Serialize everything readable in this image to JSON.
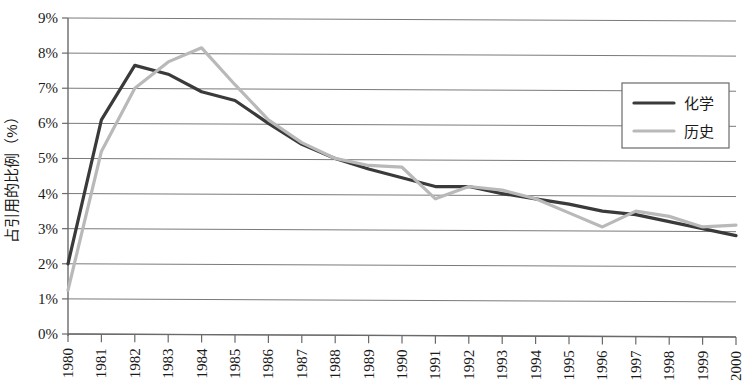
{
  "chart_data": {
    "type": "line",
    "title": "",
    "xlabel": "",
    "ylabel": "占引用的比例（%）",
    "x": [
      1980,
      1981,
      1982,
      1983,
      1984,
      1985,
      1986,
      1987,
      1988,
      1989,
      1990,
      1991,
      1992,
      1993,
      1994,
      1995,
      1996,
      1997,
      1998,
      1999,
      2000
    ],
    "categories": [
      "1980",
      "1981",
      "1982",
      "1983",
      "1984",
      "1985",
      "1986",
      "1987",
      "1988",
      "1989",
      "1990",
      "1991",
      "1992",
      "1993",
      "1994",
      "1995",
      "1996",
      "1997",
      "1998",
      "1999",
      "2000"
    ],
    "series": [
      {
        "name": "化学",
        "color": "#3a3a3a",
        "width": 3.2,
        "values": [
          2.0,
          6.1,
          7.65,
          7.4,
          6.9,
          6.65,
          6.0,
          5.4,
          5.0,
          4.7,
          4.45,
          4.2,
          4.2,
          4.0,
          3.85,
          3.7,
          3.5,
          3.4,
          3.2,
          3.0,
          2.8
        ]
      },
      {
        "name": "历史",
        "color": "#b9b9b9",
        "width": 3.2,
        "values": [
          1.25,
          5.2,
          7.0,
          7.75,
          8.15,
          7.1,
          6.1,
          5.45,
          5.0,
          4.8,
          4.75,
          3.85,
          4.2,
          4.1,
          3.85,
          3.45,
          3.05,
          3.5,
          3.35,
          3.05,
          3.1
        ]
      }
    ],
    "ylim": [
      0,
      9
    ],
    "ytick_values": [
      0,
      1,
      2,
      3,
      4,
      5,
      6,
      7,
      8,
      9
    ],
    "ytick_labels": [
      "0%",
      "1%",
      "2%",
      "3%",
      "4%",
      "5%",
      "6%",
      "7%",
      "8%",
      "9%"
    ],
    "grid": true,
    "grid_axis": "y",
    "legend_position": "top-right",
    "legend_entries": [
      "化学",
      "历史"
    ],
    "xtick_rotation": -90
  },
  "legend": {
    "items": [
      {
        "label": "化学"
      },
      {
        "label": "历史"
      }
    ]
  },
  "axes": {
    "y_title": "占引用的比例（%）"
  }
}
